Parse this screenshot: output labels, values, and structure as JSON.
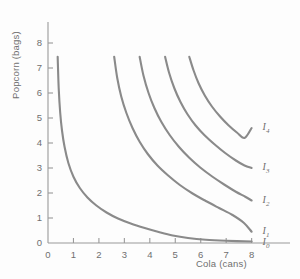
{
  "chart_data": {
    "type": "line",
    "title": "",
    "xlabel": "Cola (cans)",
    "ylabel": "Popcorn (bags)",
    "xlim": [
      0,
      8.8
    ],
    "ylim": [
      0,
      8.6
    ],
    "xticks": [
      "0",
      "1",
      "2",
      "3",
      "4",
      "5",
      "6",
      "7",
      "8"
    ],
    "yticks": [
      "0",
      "1",
      "2",
      "3",
      "4",
      "5",
      "6",
      "7",
      "8"
    ],
    "grid": false,
    "legend_position": "curve-end-labels",
    "curve_color": "#8a8a8a",
    "axis_color": "#9a9a9a",
    "text_color": "#6f6f6f",
    "series": [
      {
        "name": "I0",
        "label": "I",
        "sublabel": "0",
        "label_x": 8.35,
        "label_y": 0.02,
        "points": [
          [
            0.38,
            7.45
          ],
          [
            0.42,
            6.2
          ],
          [
            0.48,
            5.2
          ],
          [
            0.55,
            4.5
          ],
          [
            0.65,
            3.85
          ],
          [
            0.8,
            3.2
          ],
          [
            1.0,
            2.65
          ],
          [
            1.25,
            2.2
          ],
          [
            1.55,
            1.82
          ],
          [
            1.9,
            1.5
          ],
          [
            2.3,
            1.22
          ],
          [
            2.75,
            0.98
          ],
          [
            3.25,
            0.78
          ],
          [
            3.8,
            0.6
          ],
          [
            4.35,
            0.44
          ],
          [
            4.9,
            0.3
          ],
          [
            5.5,
            0.2
          ],
          [
            6.2,
            0.13
          ],
          [
            7.0,
            0.09
          ],
          [
            8.0,
            0.06
          ]
        ]
      },
      {
        "name": "I1",
        "label": "I",
        "sublabel": "1",
        "label_x": 8.35,
        "label_y": 0.45,
        "points": [
          [
            2.6,
            7.45
          ],
          [
            2.72,
            6.6
          ],
          [
            2.88,
            5.85
          ],
          [
            3.08,
            5.2
          ],
          [
            3.32,
            4.6
          ],
          [
            3.6,
            4.05
          ],
          [
            3.92,
            3.56
          ],
          [
            4.3,
            3.1
          ],
          [
            4.72,
            2.7
          ],
          [
            5.18,
            2.32
          ],
          [
            5.68,
            1.98
          ],
          [
            6.2,
            1.68
          ],
          [
            6.72,
            1.4
          ],
          [
            7.25,
            1.12
          ],
          [
            7.7,
            0.8
          ],
          [
            8.0,
            0.45
          ]
        ]
      },
      {
        "name": "I2",
        "label": "I",
        "sublabel": "2",
        "label_x": 8.35,
        "label_y": 1.7,
        "points": [
          [
            3.6,
            7.45
          ],
          [
            3.75,
            6.7
          ],
          [
            3.95,
            6.0
          ],
          [
            4.18,
            5.4
          ],
          [
            4.45,
            4.85
          ],
          [
            4.78,
            4.32
          ],
          [
            5.14,
            3.85
          ],
          [
            5.54,
            3.42
          ],
          [
            5.98,
            3.02
          ],
          [
            6.45,
            2.66
          ],
          [
            6.92,
            2.34
          ],
          [
            7.38,
            2.05
          ],
          [
            7.75,
            1.85
          ],
          [
            8.0,
            1.7
          ]
        ]
      },
      {
        "name": "I3",
        "label": "I",
        "sublabel": "3",
        "label_x": 8.35,
        "label_y": 3.0,
        "points": [
          [
            4.6,
            7.45
          ],
          [
            4.76,
            6.8
          ],
          [
            4.96,
            6.2
          ],
          [
            5.2,
            5.65
          ],
          [
            5.48,
            5.15
          ],
          [
            5.8,
            4.7
          ],
          [
            6.16,
            4.3
          ],
          [
            6.55,
            3.94
          ],
          [
            6.96,
            3.6
          ],
          [
            7.38,
            3.3
          ],
          [
            7.72,
            3.1
          ],
          [
            8.0,
            3.0
          ]
        ]
      },
      {
        "name": "I4",
        "label": "I",
        "sublabel": "4",
        "label_x": 8.35,
        "label_y": 4.6,
        "points": [
          [
            5.55,
            7.45
          ],
          [
            5.72,
            6.9
          ],
          [
            5.92,
            6.38
          ],
          [
            6.16,
            5.9
          ],
          [
            6.44,
            5.46
          ],
          [
            6.76,
            5.06
          ],
          [
            7.1,
            4.7
          ],
          [
            7.42,
            4.42
          ],
          [
            7.72,
            4.2
          ],
          [
            8.0,
            4.6
          ]
        ]
      }
    ]
  }
}
